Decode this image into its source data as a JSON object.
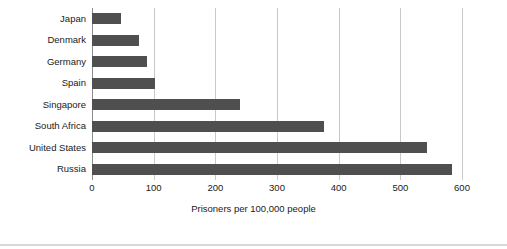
{
  "chart_data": {
    "type": "bar",
    "orientation": "horizontal",
    "title": "",
    "xlabel": "Prisoners per 100,000 people",
    "ylabel": "",
    "categories": [
      "Japan",
      "Denmark",
      "Germany",
      "Spain",
      "Singapore",
      "South Africa",
      "United States",
      "Russia"
    ],
    "values": [
      47,
      76,
      89,
      102,
      240,
      377,
      544,
      583
    ],
    "xlim": [
      0,
      600
    ],
    "xticks": [
      0,
      100,
      200,
      300,
      400,
      500,
      600
    ],
    "xtick_labels": [
      "0",
      "100",
      "200",
      "300",
      "400",
      "500",
      "600"
    ],
    "grid": "vertical",
    "legend": null,
    "bar_color": "#4f4f4f",
    "gridline_color": "#c9c9c9",
    "background_color": "#ffffff",
    "text_color": "#1a1a1a"
  }
}
